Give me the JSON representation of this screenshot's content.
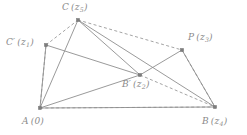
{
  "figure": {
    "kind": "geometry-diagram",
    "width": 247,
    "height": 135,
    "background_color": "#ffffff",
    "stroke_color": "#8f8f8f",
    "dashed_stroke_color": "#9a9a9a",
    "vertex_color": "#7d7d7d",
    "label_color": "#8a8a8a"
  },
  "vertices": [
    {
      "id": "C",
      "name": "vertex-c",
      "label_main": "C",
      "label_arg": "z",
      "label_sub": "5",
      "x": 78,
      "y": 20,
      "label_x": 62,
      "label_y": 3
    },
    {
      "id": "Cprime",
      "name": "vertex-c-prime",
      "label_main": "C′",
      "label_arg": "z",
      "label_sub": "1",
      "x": 46,
      "y": 45,
      "label_x": 6,
      "label_y": 38
    },
    {
      "id": "P",
      "name": "vertex-p",
      "label_main": "P",
      "label_arg": "z",
      "label_sub": "3",
      "x": 182,
      "y": 50,
      "label_x": 188,
      "label_y": 33
    },
    {
      "id": "Bprime",
      "name": "vertex-b-prime",
      "label_main": "B′",
      "label_arg": "z",
      "label_sub": "2",
      "x": 140,
      "y": 75,
      "label_x": 122,
      "label_y": 80
    },
    {
      "id": "A",
      "name": "vertex-a",
      "label_main": "A",
      "label_arg": "0",
      "label_sub": "",
      "x": 40,
      "y": 108,
      "label_x": 22,
      "label_y": 117
    },
    {
      "id": "B",
      "name": "vertex-b",
      "label_main": "B",
      "label_arg": "z",
      "label_sub": "4",
      "x": 215,
      "y": 107,
      "label_x": 202,
      "label_y": 117
    }
  ],
  "edges_solid": [
    {
      "name": "edge-a-c",
      "from": "A",
      "to": "C"
    },
    {
      "name": "edge-a-c-prime",
      "from": "A",
      "to": "Cprime"
    },
    {
      "name": "edge-a-b-prime",
      "from": "A",
      "to": "Bprime"
    },
    {
      "name": "edge-a-b",
      "from": "A",
      "to": "B"
    },
    {
      "name": "edge-c-prime-b-prime",
      "from": "Cprime",
      "to": "Bprime"
    },
    {
      "name": "edge-c-b-prime",
      "from": "C",
      "to": "Bprime"
    },
    {
      "name": "edge-c-b",
      "from": "C",
      "to": "B"
    },
    {
      "name": "edge-b-prime-p",
      "from": "Bprime",
      "to": "P"
    },
    {
      "name": "edge-p-b",
      "from": "P",
      "to": "B"
    }
  ],
  "edges_dashed": [
    {
      "name": "dashed-edge-c-prime-c",
      "from": "Cprime",
      "to": "C"
    },
    {
      "name": "dashed-edge-c-p",
      "from": "C",
      "to": "P"
    },
    {
      "name": "dashed-edge-p-b",
      "from": "P",
      "to": "B"
    },
    {
      "name": "dashed-edge-a-c-prime",
      "from": "A",
      "to": "Cprime"
    },
    {
      "name": "dashed-edge-a-b",
      "from": "A",
      "to": "B"
    },
    {
      "name": "dashed-edge-b-prime-b",
      "from": "Bprime",
      "to": "B"
    }
  ]
}
